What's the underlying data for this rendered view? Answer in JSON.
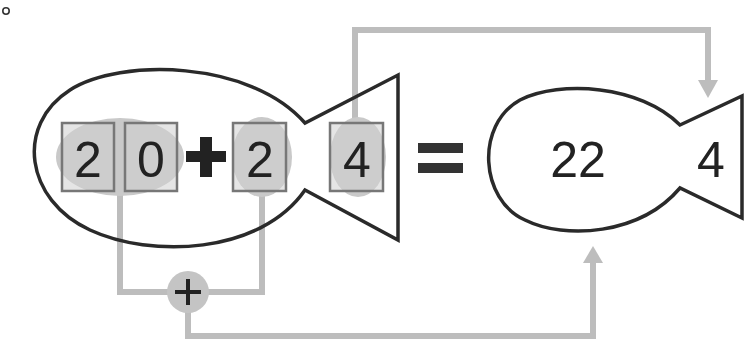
{
  "colors": {
    "outline": "#2a2a2a",
    "connector": "#bdbdbd",
    "highlight": "#c6c6c6",
    "box_fill": "#cfcfcf",
    "box_stroke": "#777777",
    "text": "#222222"
  },
  "corner_mark": "o",
  "left_fish": {
    "body_digits": [
      "2",
      "0"
    ],
    "operator": "+",
    "addend": "2",
    "tail_digit": "4"
  },
  "equals": "=",
  "right_fish": {
    "body_value": "22",
    "tail_digit": "4"
  },
  "adder_node": {
    "symbol": "+"
  }
}
